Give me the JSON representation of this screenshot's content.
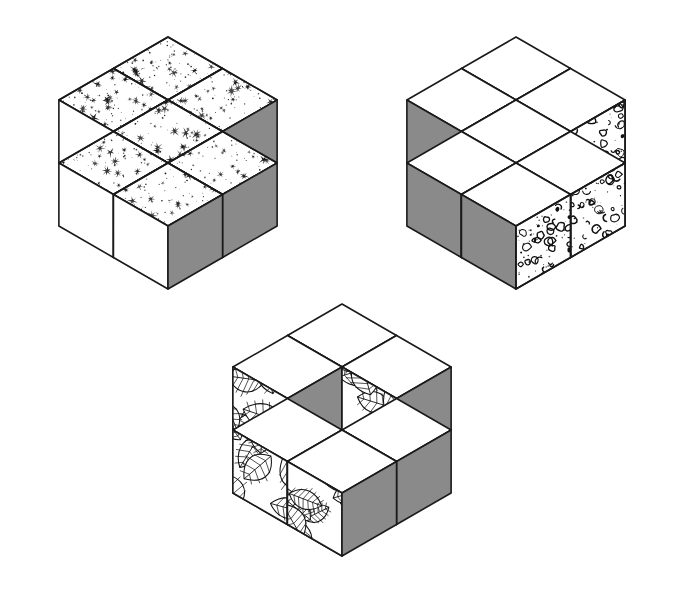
{
  "figure": {
    "background_color": "#ffffff",
    "outline_color": "#1a1a1a",
    "shaded_face_color": "#8a8a8a",
    "plain_face_color": "#ffffff",
    "canvas": {
      "width": 682,
      "height": 593
    }
  },
  "clusters": [
    {
      "id": "cluster-1",
      "name": "starburst-cube-rosette",
      "position_label": "top-left",
      "center_x": 168,
      "center_y": 163,
      "cube_size": 63,
      "cube_count": 7,
      "hollow_center": false,
      "texture_name": "starburst-speckle",
      "texture_face": "top",
      "faces": {
        "top": "starburst-speckle",
        "left": "white",
        "right": "gray"
      },
      "bounds": {
        "x": 37,
        "y": 37,
        "width": 261,
        "height": 251
      }
    },
    {
      "id": "cluster-2",
      "name": "cork-cube-rosette",
      "position_label": "top-right",
      "center_x": 516,
      "center_y": 163,
      "cube_size": 63,
      "cube_count": 7,
      "hollow_center": false,
      "texture_name": "cork-cellular",
      "texture_face": "right",
      "faces": {
        "top": "white",
        "left": "gray",
        "right": "cork-cellular"
      },
      "bounds": {
        "x": 385,
        "y": 37,
        "width": 261,
        "height": 251
      }
    },
    {
      "id": "cluster-3",
      "name": "leaf-cube-ring",
      "position_label": "bottom-center",
      "center_x": 342,
      "center_y": 430,
      "cube_size": 63,
      "cube_count": 6,
      "hollow_center": true,
      "texture_name": "leaf-foliage",
      "texture_face": "left",
      "faces": {
        "top": "white",
        "left": "leaf-foliage",
        "right": "gray"
      },
      "bounds": {
        "x": 204,
        "y": 296,
        "width": 276,
        "height": 269
      }
    }
  ],
  "ring_offsets": [
    {
      "label": "north-west",
      "u": -1,
      "v": 0,
      "w": 0
    },
    {
      "label": "north-east",
      "u": 0,
      "v": -1,
      "w": 0
    },
    {
      "label": "east",
      "u": 0,
      "v": 0,
      "w": -1
    },
    {
      "label": "south-east",
      "u": 1,
      "v": 0,
      "w": 0
    },
    {
      "label": "south-west",
      "u": 0,
      "v": 1,
      "w": 0
    },
    {
      "label": "west",
      "u": 0,
      "v": 0,
      "w": 1
    }
  ],
  "textures": [
    {
      "name": "starburst-speckle",
      "description": "scattered small star-like splats and fine dots",
      "density": 34,
      "dot_density": 90,
      "ink": "#111111"
    },
    {
      "name": "cork-cellular",
      "description": "irregular ring, comma and blob shapes like cork or sponge",
      "density": 42,
      "dot_density": 55,
      "ink": "#111111"
    },
    {
      "name": "leaf-foliage",
      "description": "overlapping outlined leaves with central midrib and side veins",
      "density": 13,
      "dot_density": 0,
      "ink": "#111111"
    }
  ]
}
